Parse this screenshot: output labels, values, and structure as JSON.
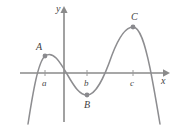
{
  "figure": {
    "background_color": "#ffffff",
    "curve_color": "#8d8d90",
    "axis_color": "#8a8a8a",
    "point_color": "#8a8a8e",
    "label_color": "#3f3f3f"
  },
  "axes": {
    "x_label": "x",
    "y_label": "y",
    "x_axis_name": "horizontal-axis",
    "y_axis_name": "vertical-axis"
  },
  "tick_labels": [
    {
      "text": "a",
      "x": 45
    },
    {
      "text": "b",
      "x": 87
    },
    {
      "text": "c",
      "x": 133
    }
  ],
  "points": [
    {
      "label": "A",
      "kind": "local-maximum",
      "x": 45,
      "y": 56
    },
    {
      "label": "B",
      "kind": "local-minimum",
      "x": 87,
      "y": 95
    },
    {
      "label": "C",
      "kind": "local-maximum",
      "x": 133,
      "y": 27
    }
  ],
  "chart_data": {
    "type": "line",
    "title": "",
    "xlabel": "x",
    "ylabel": "y",
    "grid": false,
    "legend": null,
    "xlim": [
      20,
      168
    ],
    "ylim": [
      122,
      8
    ],
    "annotations": [
      {
        "text": "A",
        "x": 45,
        "y": 56
      },
      {
        "text": "B",
        "x": 87,
        "y": 95
      },
      {
        "text": "C",
        "x": 133,
        "y": 27
      },
      {
        "text": "a",
        "x": 45,
        "y": 73
      },
      {
        "text": "b",
        "x": 87,
        "y": 73
      },
      {
        "text": "c",
        "x": 133,
        "y": 73
      }
    ],
    "series": [
      {
        "name": "f(x)",
        "path": "M 28,124 C 33,92 38,62 45,56 C 53,50 60,62 67,74 C 75,88 80,95 87,95 C 96,95 104,78 112,55 C 120,34 127,27 133,27 C 140,27 145,44 150,68 C 154,88 157,106 160,124"
      }
    ]
  }
}
